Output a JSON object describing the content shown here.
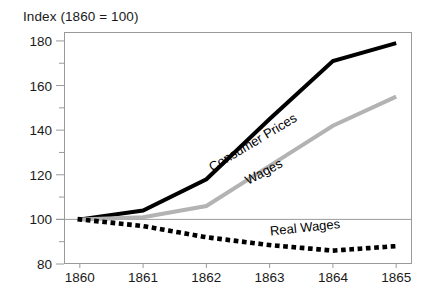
{
  "chart_data": {
    "type": "line",
    "title": "Index (1860 = 100)",
    "xlabel": "",
    "ylabel": "",
    "x": [
      1860,
      1861,
      1862,
      1863,
      1864,
      1865
    ],
    "xtick_labels": [
      "1860",
      "1861",
      "1862",
      "1863",
      "1864",
      "1865"
    ],
    "ytick_labels": [
      "80",
      "100",
      "120",
      "140",
      "160",
      "180"
    ],
    "ytick_values": [
      80,
      100,
      120,
      140,
      160,
      180
    ],
    "yminor_values": [
      90,
      110,
      130,
      150,
      170
    ],
    "ylim": [
      80,
      184
    ],
    "xlim": [
      1859.75,
      1865.25
    ],
    "grid": false,
    "reference_line": 100,
    "legend_position": "inline",
    "series": [
      {
        "name": "Consumer Prices",
        "label": "Consumer Prices",
        "color": "#000000",
        "style": "solid",
        "width": 4,
        "values": [
          100,
          104,
          118,
          145,
          171,
          179
        ],
        "label_x": 1862.05,
        "label_y": 123,
        "label_angle": -31
      },
      {
        "name": "Wages",
        "label": "Wages",
        "color": "#b3b3b3",
        "style": "solid",
        "width": 4,
        "values": [
          100,
          101,
          106,
          124,
          142,
          155
        ],
        "label_x": 1862.62,
        "label_y": 117,
        "label_angle": -28
      },
      {
        "name": "Real Wages",
        "label": "Real Wages",
        "color": "#000000",
        "style": "dotted",
        "width": 4.6,
        "values": [
          100,
          97,
          92,
          88.5,
          86,
          88
        ],
        "label_x": 1863.0,
        "label_y": 95,
        "label_angle": -6
      }
    ]
  },
  "footnote": {
    "text": ""
  }
}
